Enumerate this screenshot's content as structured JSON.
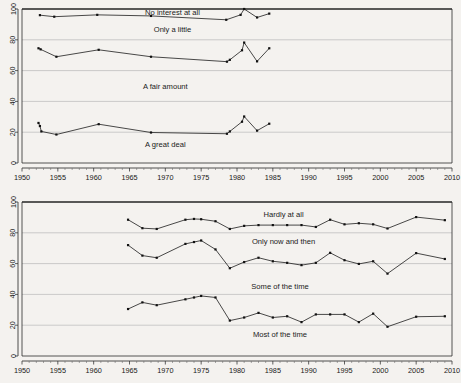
{
  "figure": {
    "background_color": "#f4f2ef",
    "line_color": "#1c1c1c",
    "grid_color": "#b9b9b9",
    "panel_count": 2
  },
  "chart_data": [
    {
      "type": "line",
      "panel": "top",
      "title": "",
      "xlabel": "",
      "ylabel": "",
      "xlim": [
        1950,
        2010
      ],
      "ylim": [
        0,
        100
      ],
      "xticks": [
        1950,
        1955,
        1960,
        1965,
        1970,
        1975,
        1980,
        1985,
        1990,
        1995,
        2000,
        2005,
        2010
      ],
      "yticks": [
        0,
        20,
        40,
        60,
        80,
        100
      ],
      "grid": "horizontal",
      "legend": "inline-annotations",
      "annotations": [
        {
          "text": "No interest at all",
          "x": 1971.0,
          "y": 98.0
        },
        {
          "text": "Only a little",
          "x": 1971.0,
          "y": 86.5
        },
        {
          "text": "A fair amount",
          "x": 1970.0,
          "y": 50.0
        },
        {
          "text": "A great deal",
          "x": 1970.0,
          "y": 12.0
        }
      ],
      "series": [
        {
          "name": "No interest at all",
          "x": [
            1952.5,
            1954.5,
            1960.5,
            1968.0,
            1978.5,
            1980.5,
            1981.0,
            1982.8,
            1984.5
          ],
          "values": [
            96.0,
            95.0,
            96.2,
            95.5,
            93.0,
            96.2,
            100.0,
            94.5,
            97.0
          ]
        },
        {
          "name": "Only a little",
          "x": [
            1952.3,
            1952.6,
            1954.8,
            1960.7,
            1968.0,
            1978.6,
            1979.0,
            1980.7,
            1981.0,
            1982.8,
            1984.5
          ],
          "values": [
            74.5,
            73.8,
            69.0,
            73.5,
            69.0,
            65.8,
            67.0,
            73.2,
            78.2,
            66.0,
            74.5
          ]
        },
        {
          "name": "A great deal",
          "x": [
            1952.3,
            1952.5,
            1952.7,
            1954.8,
            1960.7,
            1968.0,
            1978.6,
            1979.0,
            1980.7,
            1981.0,
            1982.8,
            1984.5
          ],
          "values": [
            26.0,
            24.0,
            20.5,
            18.5,
            25.2,
            19.8,
            19.0,
            20.5,
            26.8,
            30.2,
            21.0,
            25.5
          ]
        }
      ]
    },
    {
      "type": "line",
      "panel": "bottom",
      "title": "",
      "xlabel": "",
      "ylabel": "",
      "xlim": [
        1950,
        2010
      ],
      "ylim": [
        0,
        100
      ],
      "xticks": [
        1950,
        1955,
        1960,
        1965,
        1970,
        1975,
        1980,
        1985,
        1990,
        1995,
        2000,
        2005,
        2010
      ],
      "yticks": [
        0,
        20,
        40,
        60,
        80,
        100
      ],
      "grid": "horizontal",
      "legend": "inline-annotations",
      "annotations": [
        {
          "text": "Hardly at all",
          "x": 1986.5,
          "y": 92.0
        },
        {
          "text": "Only now and then",
          "x": 1986.5,
          "y": 74.5
        },
        {
          "text": "Some of the time",
          "x": 1986.0,
          "y": 45.0
        },
        {
          "text": "Most of the time",
          "x": 1986.0,
          "y": 14.0
        }
      ],
      "series": [
        {
          "name": "Hardly at all",
          "x": [
            1964.8,
            1966.8,
            1968.8,
            1972.8,
            1974.0,
            1975.0,
            1977.0,
            1979.0,
            1981.0,
            1983.0,
            1985.0,
            1987.0,
            1989.0,
            1991.0,
            1993.0,
            1995.0,
            1997.0,
            1999.0,
            2001.0,
            2005.0,
            2009.0
          ],
          "values": [
            88.5,
            83.0,
            82.5,
            88.5,
            89.0,
            88.8,
            87.5,
            82.5,
            84.5,
            85.0,
            85.0,
            85.0,
            85.0,
            83.8,
            88.5,
            85.5,
            86.2,
            85.5,
            82.8,
            90.2,
            88.2
          ]
        },
        {
          "name": "Only now and then",
          "x": [
            1964.8,
            1966.8,
            1968.8,
            1972.8,
            1974.0,
            1975.0,
            1977.0,
            1979.0,
            1981.0,
            1983.0,
            1985.0,
            1987.0,
            1989.0,
            1991.0,
            1993.0,
            1995.0,
            1997.0,
            1999.0,
            2001.0,
            2005.0,
            2009.0
          ],
          "values": [
            72.0,
            65.2,
            63.8,
            72.8,
            74.0,
            75.0,
            69.2,
            57.0,
            61.0,
            63.8,
            61.5,
            60.5,
            59.0,
            60.5,
            67.0,
            62.2,
            59.8,
            61.5,
            53.5,
            66.8,
            63.0
          ]
        },
        {
          "name": "Some of the time",
          "x": [
            1964.8,
            1966.8,
            1968.8,
            1972.8,
            1974.0,
            1975.0,
            1977.0,
            1979.0,
            1981.0,
            1983.0,
            1985.0,
            1987.0,
            1989.0,
            1991.0,
            1993.0,
            1995.0,
            1997.0,
            1999.0,
            2001.0,
            2005.0,
            2009.0
          ],
          "values": [
            30.5,
            34.8,
            33.0,
            36.8,
            38.0,
            39.0,
            38.0,
            23.0,
            25.0,
            28.0,
            25.0,
            25.8,
            22.0,
            27.0,
            27.0,
            27.0,
            22.0,
            27.5,
            19.0,
            25.5,
            25.8
          ]
        }
      ]
    }
  ]
}
